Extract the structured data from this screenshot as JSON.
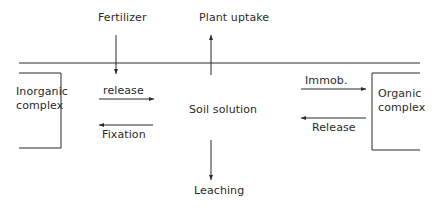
{
  "diagram": {
    "nodes": {
      "fertilizer": "Fertilizer",
      "plant_uptake": "Plant uptake",
      "soil_solution": "Soil solution",
      "leaching": "Leaching",
      "inorganic_complex": {
        "line1": "Inorganic",
        "line2": "complex"
      },
      "organic_complex": {
        "line1": "Organic",
        "line2": "complex"
      }
    },
    "edges": {
      "release_inorganic": "release",
      "fixation": "Fixation",
      "immobilization": "Immob.",
      "release_organic": "Release"
    },
    "relations": [
      {
        "from": "Fertilizer",
        "to": "Soil solution"
      },
      {
        "from": "Soil solution",
        "to": "Plant uptake"
      },
      {
        "from": "Soil solution",
        "to": "Leaching"
      },
      {
        "from": "Inorganic complex",
        "to": "Soil solution",
        "label": "release"
      },
      {
        "from": "Soil solution",
        "to": "Inorganic complex",
        "label": "Fixation"
      },
      {
        "from": "Soil solution",
        "to": "Organic complex",
        "label": "Immob."
      },
      {
        "from": "Organic complex",
        "to": "Soil solution",
        "label": "Release"
      }
    ],
    "colors": {
      "line": "#2a2a2a",
      "background": "#ffffff"
    }
  }
}
